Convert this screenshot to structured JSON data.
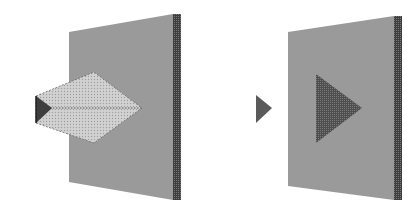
{
  "figure": {
    "colors": {
      "background": "#ffffff",
      "screen_face": "#9a9a9a",
      "screen_edge": "#4a4a4a",
      "beam_fill": "#c8c8c8",
      "beam_edge": "#5a5a5a",
      "object_triangle": "#4a4a4a",
      "projected_triangle": "#5c5c5c"
    },
    "left_panel": {
      "screen": {
        "points": "69,32 173,14 173,200 69,182",
        "edge_points": "173,14 181,14 181,200 173,200"
      },
      "beam": {
        "points": "36,96 94,72 142,108 94,143 36,123",
        "axis": {
          "x1": 50,
          "y1": 108,
          "x2": 142,
          "y2": 108
        }
      },
      "object": {
        "points": "36,96 52,108 36,123"
      }
    },
    "right_panel": {
      "screen": {
        "points": "288,32 394,16 394,200 288,186",
        "edge_points": "394,16 402,16 402,200 394,200"
      },
      "object": {
        "points": "256,95 272,108 256,123"
      },
      "image": {
        "points": "316,74 362,108 316,143"
      }
    }
  }
}
